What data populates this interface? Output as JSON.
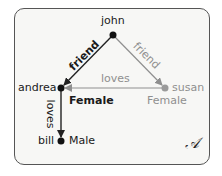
{
  "diagram": {
    "nodes": [
      {
        "id": "john",
        "label": "john",
        "color": "#111111"
      },
      {
        "id": "andrea",
        "label": "andrea",
        "color": "#111111",
        "attribute": "Female"
      },
      {
        "id": "susan",
        "label": "susan",
        "color": "#999999",
        "attribute": "Female"
      },
      {
        "id": "bill",
        "label": "bill",
        "color": "#111111",
        "attribute": "Male"
      }
    ],
    "edges": [
      {
        "from": "john",
        "to": "andrea",
        "label": "friend",
        "color": "#222222"
      },
      {
        "from": "john",
        "to": "susan",
        "label": "friend",
        "color": "#8f8f8f"
      },
      {
        "from": "susan",
        "to": "andrea",
        "label": "loves",
        "color": "#8f8f8f"
      },
      {
        "from": "andrea",
        "to": "bill",
        "label": "loves",
        "color": "#222222"
      }
    ],
    "structure_label": "𝒜"
  }
}
